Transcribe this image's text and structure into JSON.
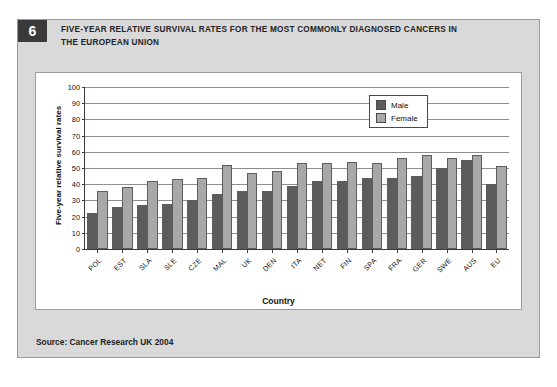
{
  "figure": {
    "number": "6",
    "title": "FIVE-YEAR RELATIVE SURVIVAL RATES FOR THE MOST COMMONLY DIAGNOSED CANCERS IN THE EUROPEAN UNION",
    "source_label": "Source:",
    "source_value": "Cancer Research UK 2004"
  },
  "legend": {
    "entries": [
      {
        "label": "Male",
        "color": "#5c5c5c"
      },
      {
        "label": "Female",
        "color": "#a8a8a8"
      }
    ]
  },
  "chart_data": {
    "type": "bar",
    "title": "FIVE-YEAR RELATIVE SURVIVAL RATES FOR THE MOST COMMONLY DIAGNOSED CANCERS IN THE EUROPEAN UNION",
    "xlabel": "Country",
    "ylabel": "Five-year relative survival rates",
    "ylim": [
      0,
      100
    ],
    "yticks": [
      0,
      10,
      20,
      30,
      40,
      50,
      60,
      70,
      80,
      90,
      100
    ],
    "grid": true,
    "legend_position": "top-right",
    "categories": [
      "POL",
      "EST",
      "SLA",
      "SLE",
      "CZE",
      "MAL",
      "UK",
      "DEN",
      "ITA",
      "NET",
      "FIN",
      "SPA",
      "FRA",
      "GER",
      "SWE",
      "AUS",
      "EU"
    ],
    "series": [
      {
        "name": "Male",
        "color": "#5c5c5c",
        "values": [
          22,
          26,
          27,
          28,
          30,
          34,
          36,
          36,
          39,
          42,
          42,
          44,
          44,
          45,
          50,
          55,
          40
        ]
      },
      {
        "name": "Female",
        "color": "#a8a8a8",
        "values": [
          36,
          38,
          42,
          43,
          44,
          52,
          47,
          48,
          53,
          53,
          54,
          53,
          56,
          58,
          56,
          58,
          51
        ]
      }
    ]
  }
}
